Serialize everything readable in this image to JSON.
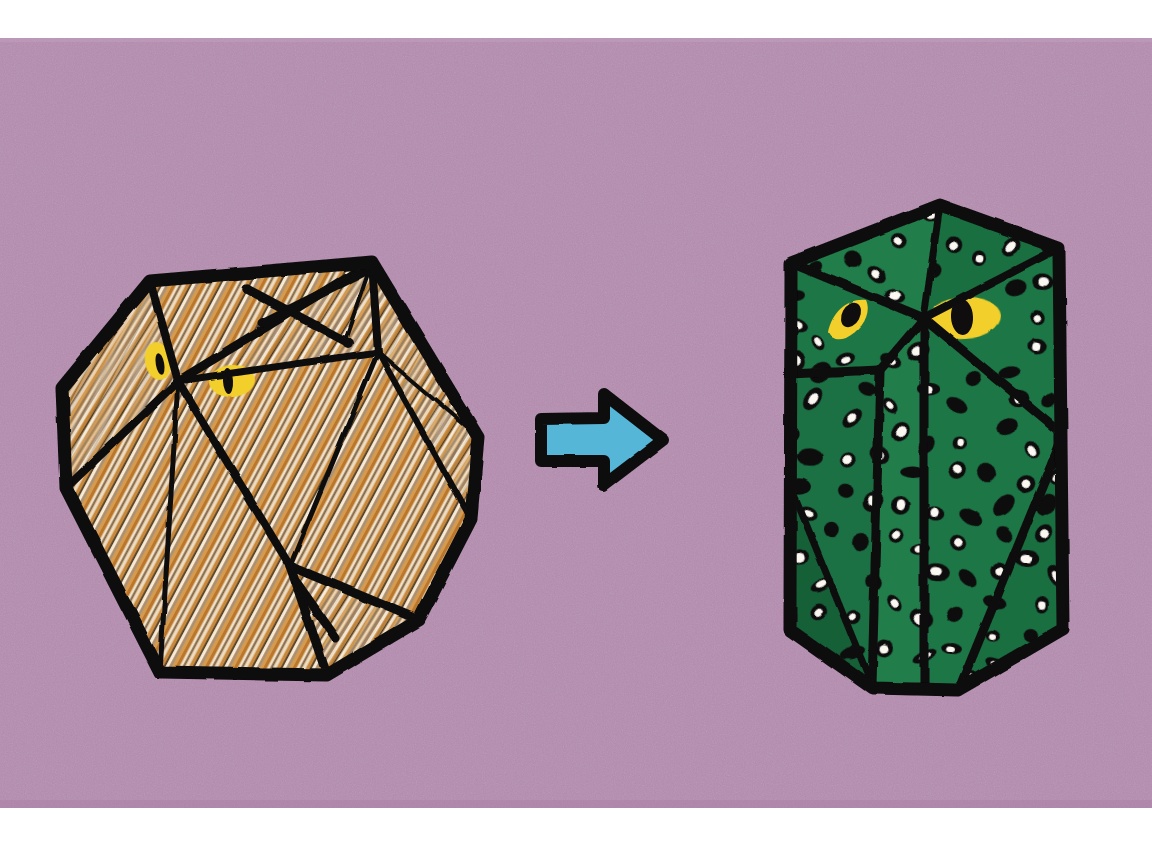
{
  "scene": {
    "title": "Owl polyhedron transformation",
    "description": "Two stylized low-poly owl figures on a mauve background, joined by a blue arrow pointing right",
    "canvas": {
      "width": 1152,
      "height": 847
    }
  },
  "colors": {
    "page_background": "#ffffff",
    "backdrop_mauve": "#b58cb0",
    "backdrop_mauve_dark": "#a97fa6",
    "ink_black": "#100d0f",
    "owl_left_base": "#c8873a",
    "owl_left_tan": "#d9a05a",
    "owl_left_cream": "#f3ece0",
    "owl_left_gray": "#8c857c",
    "owl_right_green": "#1e7a47",
    "owl_right_green_dark": "#176239",
    "spot_white": "#fbf8f2",
    "eye_yellow": "#f2cf2a",
    "arrow_blue": "#56b6d8"
  },
  "backdrop": {
    "name": "mauve-paper-backdrop",
    "x": 0,
    "y": 38,
    "width": 1152,
    "height": 770
  },
  "owl_left": {
    "label": "hatched brown owl polyhedron",
    "bounds": {
      "x": 62,
      "y": 262,
      "width": 418,
      "height": 415
    },
    "fill_style": "diagonal-hatching",
    "outline_width": 11,
    "outer_polygon": [
      [
        150,
        281
      ],
      [
        372,
        262
      ],
      [
        478,
        437
      ],
      [
        471,
        519
      ],
      [
        419,
        620
      ],
      [
        327,
        675
      ],
      [
        160,
        672
      ],
      [
        66,
        488
      ],
      [
        62,
        388
      ]
    ],
    "edges": [
      [
        [
          150,
          281
        ],
        [
          178,
          381
        ]
      ],
      [
        [
          178,
          381
        ],
        [
          66,
          488
        ]
      ],
      [
        [
          178,
          381
        ],
        [
          160,
          672
        ]
      ],
      [
        [
          178,
          381
        ],
        [
          372,
          262
        ]
      ],
      [
        [
          178,
          381
        ],
        [
          378,
          352
        ]
      ],
      [
        [
          178,
          381
        ],
        [
          290,
          566
        ]
      ],
      [
        [
          290,
          566
        ],
        [
          378,
          352
        ]
      ],
      [
        [
          290,
          566
        ],
        [
          327,
          675
        ]
      ],
      [
        [
          290,
          566
        ],
        [
          419,
          620
        ]
      ],
      [
        [
          378,
          352
        ],
        [
          471,
          519
        ]
      ],
      [
        [
          378,
          352
        ],
        [
          372,
          262
        ]
      ],
      [
        [
          419,
          620
        ],
        [
          471,
          519
        ]
      ],
      [
        [
          290,
          566
        ],
        [
          160,
          672
        ]
      ],
      [
        [
          378,
          352
        ],
        [
          478,
          437
        ]
      ],
      [
        [
          262,
          288
        ],
        [
          372,
          262
        ]
      ],
      [
        [
          262,
          288
        ],
        [
          345,
          340
        ]
      ]
    ],
    "whisker_marks": [
      {
        "name": "brow-mark-upper",
        "from": [
          247,
          289
        ],
        "to": [
          345,
          341
        ]
      },
      {
        "name": "brow-mark-lower",
        "from": [
          372,
          267
        ],
        "to": [
          262,
          322
        ]
      },
      {
        "name": "beak-mark",
        "from": [
          297,
          583
        ],
        "to": [
          335,
          637
        ]
      }
    ],
    "eyes": [
      {
        "name": "eye-left",
        "cx": 158,
        "cy": 361,
        "rx": 13,
        "ry": 19,
        "rot": -10,
        "pupil_rx": 4,
        "pupil_ry": 11
      },
      {
        "name": "eye-right",
        "cx": 232,
        "cy": 381,
        "rx": 22,
        "ry": 16,
        "rot": -4,
        "pupil_rx": 5,
        "pupil_ry": 13
      }
    ]
  },
  "owl_right": {
    "label": "green speckled owl polyhedron",
    "bounds": {
      "x": 784,
      "y": 200,
      "width": 282,
      "height": 492
    },
    "fill_style": "speckled-dots",
    "outline_width": 10,
    "outer_polygon": [
      [
        940,
        205
      ],
      [
        1059,
        248
      ],
      [
        1063,
        629
      ],
      [
        958,
        690
      ],
      [
        872,
        688
      ],
      [
        790,
        630
      ],
      [
        791,
        263
      ]
    ],
    "edges": [
      [
        [
          791,
          263
        ],
        [
          940,
          205
        ]
      ],
      [
        [
          940,
          205
        ],
        [
          1059,
          248
        ]
      ],
      [
        [
          791,
          263
        ],
        [
          924,
          318
        ]
      ],
      [
        [
          924,
          318
        ],
        [
          1059,
          248
        ]
      ],
      [
        [
          924,
          318
        ],
        [
          1063,
          434
        ]
      ],
      [
        [
          924,
          318
        ],
        [
          924,
          688
        ]
      ],
      [
        [
          924,
          318
        ],
        [
          880,
          370
        ]
      ],
      [
        [
          880,
          370
        ],
        [
          791,
          374
        ]
      ],
      [
        [
          791,
          374
        ],
        [
          880,
          370
        ]
      ],
      [
        [
          880,
          370
        ],
        [
          872,
          688
        ]
      ],
      [
        [
          791,
          485
        ],
        [
          872,
          688
        ]
      ],
      [
        [
          924,
          318
        ],
        [
          1063,
          434
        ]
      ],
      [
        [
          1063,
          434
        ],
        [
          958,
          690
        ]
      ],
      [
        [
          791,
          374
        ],
        [
          791,
          630
        ]
      ]
    ],
    "eyes": [
      {
        "name": "eye-left",
        "cx": 853,
        "cy": 314,
        "rx": 23,
        "ry": 14,
        "rot": 24,
        "pupil_rx": 8,
        "pupil_ry": 11
      },
      {
        "name": "eye-right",
        "cx": 964,
        "cy": 318,
        "rx": 35,
        "ry": 20,
        "rot": -5,
        "pupil_rx": 10,
        "pupil_ry": 16
      }
    ],
    "spot_count": 96
  },
  "arrow": {
    "name": "transformation-arrow",
    "direction": "right",
    "bounds": {
      "x": 533,
      "y": 392,
      "width": 133,
      "height": 95
    },
    "points": [
      [
        541,
        419
      ],
      [
        604,
        418
      ],
      [
        604,
        394
      ],
      [
        663,
        440
      ],
      [
        604,
        485
      ],
      [
        604,
        461
      ],
      [
        541,
        461
      ]
    ],
    "fill": "#56b6d8",
    "stroke": "#100d0f",
    "stroke_width": 11
  }
}
